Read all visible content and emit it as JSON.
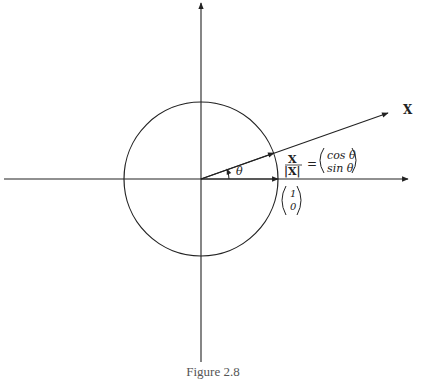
{
  "figure": {
    "caption": "Figure 2.8",
    "labels": {
      "vector_name": "X",
      "angle": "θ",
      "unit_vector_numerator": "X",
      "unit_vector_denominator": "|X|",
      "equals": "=",
      "cos_entry": "cos θ",
      "sin_entry": "sin θ",
      "basis_top": "1",
      "basis_bottom": "0"
    },
    "geometry": {
      "origin": [
        201,
        179
      ],
      "radius": 77,
      "angle_deg": 20,
      "x_axis": {
        "from": 4,
        "to": 410
      },
      "y_axis": {
        "from": 0,
        "to": 362
      }
    },
    "colors": {
      "stroke": "#222222",
      "background": "#ffffff"
    }
  }
}
